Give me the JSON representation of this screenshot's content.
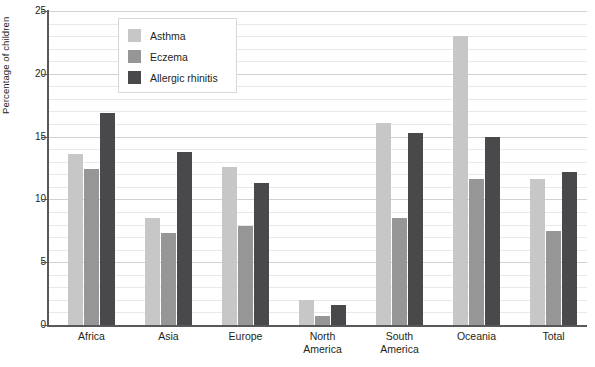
{
  "chart_data": {
    "type": "bar",
    "title": "",
    "subtitle": "",
    "xlabel": "",
    "ylabel": "Percentage of children",
    "ylim": [
      0,
      25
    ],
    "yticks": [
      0,
      5,
      10,
      15,
      20,
      25
    ],
    "yticklabels": [
      "0",
      "5",
      "10",
      "15",
      "20",
      "25"
    ],
    "minor_gridline_step": 1,
    "grid": true,
    "legend_position": "top-left-inset",
    "categories": [
      "Africa",
      "Asia",
      "Europe",
      "North America",
      "South America",
      "Oceania",
      "Total"
    ],
    "category_lines": [
      [
        "Africa"
      ],
      [
        "Asia"
      ],
      [
        "Europe"
      ],
      [
        "North",
        "America"
      ],
      [
        "South",
        "America"
      ],
      [
        "Oceania"
      ],
      [
        "Total"
      ]
    ],
    "series": [
      {
        "name": "Asthma",
        "color": "#c6c7c6",
        "values": [
          13.6,
          8.5,
          12.6,
          2.0,
          16.1,
          23.0,
          11.6
        ]
      },
      {
        "name": "Eczema",
        "color": "#969696",
        "values": [
          12.4,
          7.3,
          7.9,
          0.7,
          8.5,
          11.6,
          7.5
        ]
      },
      {
        "name": "Allergic rhinitis",
        "color": "#49494b",
        "values": [
          16.9,
          13.8,
          11.3,
          1.6,
          15.3,
          15.0,
          12.2
        ]
      }
    ]
  },
  "axis": {
    "y_title": "Percentage of children"
  },
  "legend": {
    "items": [
      {
        "label": "Asthma",
        "color": "#c6c7c6"
      },
      {
        "label": "Eczema",
        "color": "#969696"
      },
      {
        "label": "Allergic rhinitis",
        "color": "#49494b"
      }
    ]
  },
  "colors": {
    "axis": "#58585a",
    "gridline_minor": "#e9e9e9",
    "gridline_major": "#d2d2d2",
    "text": "#231f20",
    "background": "#ffffff",
    "legend_border": "#d8d8d8"
  }
}
